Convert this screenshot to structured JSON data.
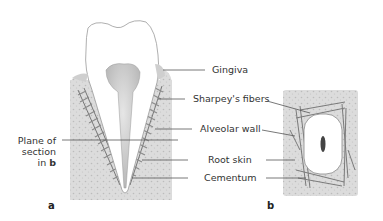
{
  "figure": {
    "panel_a": {
      "label": "a",
      "left_label": [
        "Plane of",
        "section",
        "in "
      ],
      "left_label_bold": "b"
    },
    "panel_b": {
      "label": "b"
    },
    "labels": [
      {
        "id": "gingiva",
        "text": "Gingiva"
      },
      {
        "id": "sharpeys-fibers",
        "text": "Sharpey's fibers"
      },
      {
        "id": "alveolar-wall",
        "text": "Alveolar wall"
      },
      {
        "id": "root-skin",
        "text": "Root skin"
      },
      {
        "id": "cementum",
        "text": "Cementum"
      }
    ],
    "colors": {
      "bone": "#d9d9d9",
      "bone_speckle": "#bdbdbd",
      "tooth": "#ffffff",
      "pulp": "#cfcfcf",
      "fibers": "#8a8a8a",
      "leader": "#555555"
    }
  }
}
